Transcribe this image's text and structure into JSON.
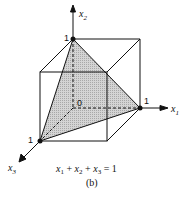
{
  "figure": {
    "type": "3d-unit-cube-with-simplex-plane",
    "axes": [
      {
        "name": "x1",
        "label": "x",
        "subscript": "1"
      },
      {
        "name": "x2",
        "label": "x",
        "subscript": "2"
      },
      {
        "name": "x3",
        "label": "x",
        "subscript": "3"
      }
    ],
    "origin_label": "0",
    "vertex_labels": {
      "x1": "1",
      "x2": "1",
      "x3": "1"
    },
    "equation": "x₁ + x₂ + x₃ = 1",
    "equation_parts": {
      "t1": "x",
      "s1": "1",
      "p1": " + ",
      "t2": "x",
      "s2": "2",
      "p2": " + ",
      "t3": "x",
      "s3": "3",
      "eq": " = 1"
    },
    "caption": "(b)",
    "caption_letter": "b",
    "colors": {
      "shade": "#c9c9c9",
      "line": "#111111"
    }
  }
}
